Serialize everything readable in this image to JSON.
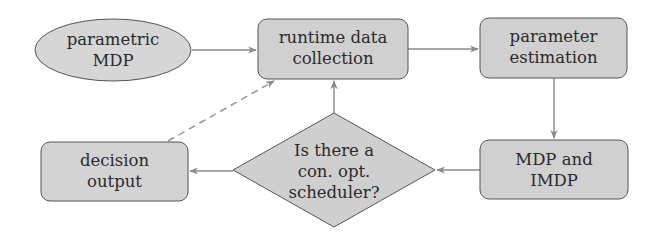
{
  "diagram": {
    "colors": {
      "node_fill": "#d3d3d3",
      "node_stroke": "#555555",
      "edge": "#8a8a8a",
      "text": "#2b2b2b"
    },
    "nodes": [
      {
        "id": "parametric-mdp",
        "shape": "ellipse",
        "lines": [
          "parametric",
          "MDP"
        ]
      },
      {
        "id": "runtime-data-collection",
        "shape": "rounded-rect",
        "lines": [
          "runtime data",
          "collection"
        ]
      },
      {
        "id": "parameter-estimation",
        "shape": "rounded-rect",
        "lines": [
          "parameter",
          "estimation"
        ]
      },
      {
        "id": "mdp-and-imdp",
        "shape": "rounded-rect",
        "lines": [
          "MDP and",
          "IMDP"
        ]
      },
      {
        "id": "scheduler-check",
        "shape": "diamond",
        "lines": [
          "Is there a",
          "con. opt.",
          "scheduler?"
        ]
      },
      {
        "id": "decision-output",
        "shape": "rounded-rect",
        "lines": [
          "decision",
          "output"
        ]
      }
    ],
    "edges": [
      {
        "from": "parametric-mdp",
        "to": "runtime-data-collection",
        "style": "solid"
      },
      {
        "from": "runtime-data-collection",
        "to": "parameter-estimation",
        "style": "solid"
      },
      {
        "from": "parameter-estimation",
        "to": "mdp-and-imdp",
        "style": "solid"
      },
      {
        "from": "mdp-and-imdp",
        "to": "scheduler-check",
        "style": "solid"
      },
      {
        "from": "scheduler-check",
        "to": "runtime-data-collection",
        "style": "solid"
      },
      {
        "from": "scheduler-check",
        "to": "decision-output",
        "style": "solid"
      },
      {
        "from": "decision-output",
        "to": "runtime-data-collection",
        "style": "dashed"
      }
    ]
  }
}
